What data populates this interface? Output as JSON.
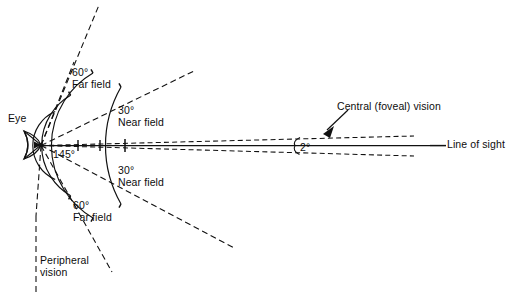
{
  "diagram": {
    "type": "schematic-vision-cone",
    "eye_label": "Eye",
    "line_of_sight_label": "Line of sight",
    "central_vision_label": "Central (foveal) vision",
    "peripheral_vision_label": "Peripheral\nvision",
    "angles": {
      "foveal": "2°",
      "near_field_upper": "30°",
      "near_field_lower": "30°",
      "far_field_upper": "60°",
      "far_field_lower": "60°",
      "peripheral_total": "145°"
    },
    "labels": {
      "eye": "Eye",
      "foveal_angle": "2°",
      "central_vision": "Central (foveal) vision",
      "line_of_sight": "Line of sight",
      "near_field_upper_angle": "30°",
      "near_field_upper_name": "Near field",
      "near_field_lower_angle": "30°",
      "near_field_lower_name": "Near field",
      "far_field_upper_angle": "60°",
      "far_field_upper_name": "Far field",
      "far_field_lower_angle": "60°",
      "far_field_lower_name": "Far field",
      "peripheral_angle": "145°",
      "peripheral_line1": "Peripheral",
      "peripheral_line2": "vision"
    },
    "colors": {
      "ink": "#111111",
      "background": "#ffffff"
    }
  }
}
